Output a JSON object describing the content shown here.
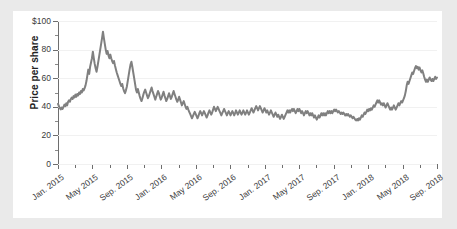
{
  "card": {
    "background": "#ffffff",
    "page_background": "#eaeaea"
  },
  "chart_data": {
    "type": "line",
    "title": "",
    "subtitle": "",
    "xlabel": "",
    "ylabel": "Price per share",
    "ylim": [
      0,
      100
    ],
    "ytick_values": [
      0,
      20,
      40,
      60,
      80,
      100
    ],
    "ytick_labels": [
      "0",
      "20",
      "40",
      "60",
      "80",
      "$100"
    ],
    "y_minor_ticks": [
      10,
      30,
      50,
      70,
      90
    ],
    "grid": true,
    "grid_axis": "y",
    "grid_color": "#f1f1f1",
    "legend": false,
    "legend_position": "none",
    "line_color": "#808080",
    "line_width": 2,
    "axis_color": "#6e6e6e",
    "xlim": [
      "Jan. 2015",
      "Sep. 2018"
    ],
    "xtick_labels": [
      "Jan. 2015",
      "May 2015",
      "Sep. 2015",
      "Jan. 2016",
      "May 2016",
      "Sep. 2016",
      "Jan. 2017",
      "May 2017",
      "Sep. 2017",
      "Jan. 2018",
      "May 2018",
      "Sep. 2018"
    ],
    "x_unit": "month",
    "x_start": "2015-01",
    "x_end": "2018-09",
    "series": [
      {
        "name": "Price per share",
        "color": "#808080",
        "values": [
          42.0,
          40.5,
          39.0,
          38.2,
          39.5,
          38.5,
          40.0,
          41.5,
          40.5,
          42.5,
          41.0,
          43.5,
          44.5,
          43.5,
          45.5,
          46.5,
          45.5,
          47.5,
          46.5,
          48.5,
          47.0,
          49.0,
          48.0,
          50.0,
          49.0,
          51.0,
          50.0,
          52.5,
          51.5,
          53.0,
          55.0,
          58.0,
          62.0,
          66.0,
          63.0,
          68.0,
          71.0,
          74.0,
          78.5,
          74.0,
          70.0,
          67.0,
          64.5,
          68.0,
          72.0,
          76.0,
          80.0,
          84.0,
          88.0,
          92.5,
          88.0,
          84.0,
          80.0,
          77.0,
          79.0,
          76.0,
          74.0,
          76.5,
          74.0,
          72.0,
          70.5,
          72.0,
          69.0,
          66.5,
          64.0,
          62.0,
          60.0,
          58.0,
          56.0,
          54.5,
          56.0,
          53.0,
          51.0,
          49.5,
          51.5,
          54.0,
          58.0,
          62.0,
          66.0,
          69.5,
          71.5,
          68.0,
          64.0,
          60.0,
          56.0,
          52.0,
          50.0,
          52.5,
          50.0,
          47.5,
          45.5,
          44.0,
          46.0,
          48.5,
          50.5,
          52.0,
          50.0,
          48.0,
          46.0,
          47.5,
          49.5,
          51.5,
          53.5,
          51.0,
          49.0,
          47.0,
          45.0,
          47.0,
          49.0,
          51.0,
          49.5,
          47.0,
          45.0,
          46.5,
          48.5,
          50.5,
          48.0,
          46.0,
          44.0,
          45.5,
          47.5,
          49.5,
          47.5,
          45.5,
          47.0,
          49.0,
          51.0,
          49.0,
          47.0,
          45.0,
          43.5,
          45.0,
          47.0,
          45.0,
          43.0,
          41.0,
          42.5,
          44.0,
          42.0,
          40.0,
          38.5,
          40.0,
          38.0,
          36.5,
          35.0,
          33.5,
          32.0,
          33.5,
          35.0,
          36.5,
          35.0,
          33.5,
          32.0,
          33.5,
          35.5,
          37.0,
          35.5,
          34.0,
          35.5,
          37.0,
          35.5,
          34.0,
          32.5,
          34.0,
          36.0,
          37.5,
          36.0,
          34.5,
          36.0,
          38.0,
          40.0,
          38.5,
          37.0,
          38.5,
          40.0,
          38.5,
          37.0,
          35.5,
          34.0,
          35.5,
          37.0,
          38.5,
          37.0,
          35.5,
          34.0,
          35.5,
          37.0,
          35.5,
          34.0,
          35.5,
          37.0,
          35.5,
          34.0,
          35.5,
          37.5,
          36.0,
          34.5,
          36.0,
          37.5,
          36.0,
          34.5,
          36.0,
          37.5,
          36.0,
          34.5,
          36.0,
          37.5,
          36.0,
          34.5,
          36.0,
          37.5,
          39.0,
          37.5,
          36.0,
          37.5,
          39.0,
          40.5,
          39.0,
          37.5,
          39.0,
          40.5,
          39.0,
          37.5,
          36.0,
          37.5,
          39.0,
          37.5,
          36.0,
          37.5,
          36.0,
          34.5,
          36.0,
          37.5,
          36.0,
          34.5,
          33.0,
          34.5,
          36.0,
          34.5,
          33.0,
          34.5,
          33.0,
          31.5,
          33.0,
          34.5,
          33.0,
          31.5,
          33.0,
          34.5,
          36.0,
          37.5,
          36.0,
          37.5,
          36.0,
          37.5,
          38.5,
          37.0,
          38.5,
          37.0,
          35.5,
          37.0,
          38.5,
          37.0,
          38.5,
          37.0,
          35.5,
          37.0,
          35.5,
          34.0,
          35.5,
          37.0,
          35.5,
          37.0,
          35.5,
          34.0,
          35.5,
          34.0,
          35.5,
          34.0,
          32.5,
          34.0,
          32.5,
          31.0,
          32.5,
          34.0,
          32.5,
          34.0,
          35.5,
          34.0,
          35.5,
          34.0,
          35.5,
          34.0,
          35.5,
          37.0,
          35.5,
          37.0,
          35.5,
          37.0,
          35.5,
          37.0,
          38.0,
          37.0,
          38.0,
          37.0,
          36.0,
          37.0,
          36.0,
          35.0,
          36.0,
          35.0,
          36.0,
          35.0,
          34.0,
          35.0,
          34.0,
          35.0,
          34.0,
          33.0,
          34.0,
          33.0,
          32.0,
          33.0,
          32.0,
          31.0,
          30.5,
          31.5,
          30.5,
          32.0,
          31.0,
          32.5,
          34.0,
          33.0,
          34.5,
          36.0,
          35.0,
          36.5,
          38.0,
          37.0,
          38.5,
          37.5,
          39.0,
          38.0,
          39.5,
          41.0,
          40.0,
          41.5,
          43.0,
          44.5,
          43.0,
          44.5,
          43.0,
          41.5,
          42.5,
          41.0,
          42.5,
          41.0,
          39.5,
          41.0,
          42.5,
          41.0,
          39.5,
          38.0,
          39.5,
          38.0,
          39.5,
          41.0,
          39.5,
          38.0,
          39.5,
          41.0,
          42.5,
          41.0,
          42.5,
          44.0,
          43.0,
          44.5,
          46.0,
          48.0,
          51.0,
          55.0,
          57.5,
          56.0,
          58.0,
          60.0,
          62.0,
          64.0,
          63.0,
          65.0,
          67.0,
          68.5,
          67.0,
          68.0,
          66.0,
          67.5,
          65.5,
          64.0,
          65.5,
          63.5,
          61.0,
          59.0,
          57.5,
          59.0,
          57.5,
          59.0,
          60.5,
          59.0,
          58.0,
          59.5,
          58.0,
          59.5,
          61.0,
          59.5,
          60.5
        ]
      }
    ]
  }
}
